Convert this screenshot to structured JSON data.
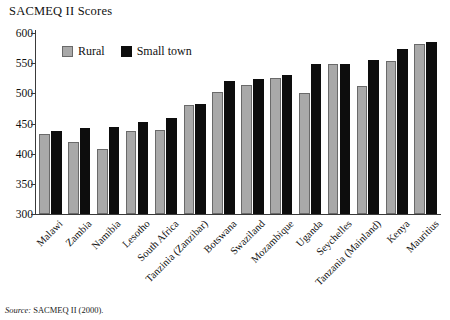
{
  "chart_title": "SACMEQ II Scores",
  "source": {
    "keyword": "Source:",
    "text": " SACMEQ II (2000)."
  },
  "legend": {
    "position": "top-left-inside",
    "items": [
      {
        "label": "Rural",
        "color": "#a9a9a9"
      },
      {
        "label": "Small town",
        "color": "#0d0d0d"
      }
    ]
  },
  "yaxis": {
    "ticks": [
      "300",
      "350",
      "400",
      "450",
      "500",
      "550",
      "600"
    ]
  },
  "chart_data": {
    "type": "bar",
    "title": "SACMEQ II Scores",
    "xlabel": "",
    "ylabel": "",
    "ylim": [
      300,
      600
    ],
    "ytick_step": 50,
    "grid": false,
    "legend_position": "top-left-inside",
    "categories": [
      "Malawi",
      "Zambia",
      "Namibia",
      "Lesotho",
      "South Africa",
      "Tanzinia (Zanzibar)",
      "Botswana",
      "Swaziland",
      "Mozambique",
      "Uganda",
      "Seychelles",
      "Tanzania (Mainland)",
      "Kenya",
      "Mauritius"
    ],
    "series": [
      {
        "name": "Rural",
        "color": "#a9a9a9",
        "values": [
          433,
          420,
          407,
          437,
          439,
          480,
          503,
          514,
          526,
          501,
          548,
          512,
          554,
          581
        ]
      },
      {
        "name": "Small town",
        "color": "#0d0d0d",
        "values": [
          437,
          443,
          445,
          452,
          459,
          483,
          520,
          523,
          530,
          548,
          548,
          556,
          574,
          585
        ]
      }
    ]
  }
}
